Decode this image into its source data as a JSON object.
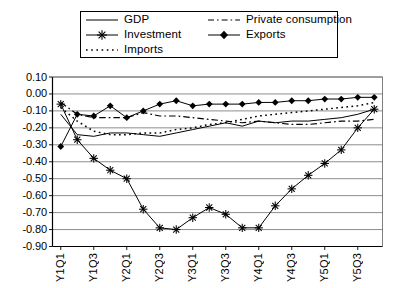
{
  "chart_data": {
    "type": "line",
    "title": "",
    "subtitle": "",
    "xlabel": "",
    "ylabel": "",
    "grid": "horizontal",
    "legend_position": "top",
    "ylim": [
      -0.9,
      0.1
    ],
    "ytick_step": 0.1,
    "ytick_labels": [
      "0.10",
      "0.00",
      "-0.10",
      "-0.20",
      "-0.30",
      "-0.40",
      "-0.50",
      "-0.60",
      "-0.70",
      "-0.80",
      "-0.90"
    ],
    "ytick_values": [
      0.1,
      0.0,
      -0.1,
      -0.2,
      -0.3,
      -0.4,
      -0.5,
      -0.6,
      -0.7,
      -0.8,
      -0.9
    ],
    "x": [
      "Y1Q1",
      "Y1Q2",
      "Y1Q3",
      "Y1Q4",
      "Y2Q1",
      "Y2Q2",
      "Y2Q3",
      "Y2Q4",
      "Y3Q1",
      "Y3Q2",
      "Y3Q3",
      "Y3Q4",
      "Y4Q1",
      "Y4Q2",
      "Y4Q3",
      "Y4Q4",
      "Y5Q1",
      "Y5Q2",
      "Y5Q3",
      "Y5Q4"
    ],
    "xtick_labels": [
      "Y1Q1",
      "Y1Q3",
      "Y2Q1",
      "Y2Q3",
      "Y3Q1",
      "Y3Q3",
      "Y4Q1",
      "Y4Q3",
      "Y5Q1",
      "Y5Q3"
    ],
    "xtick_every": 2,
    "series": [
      {
        "name": "GDP",
        "style": "solid",
        "marker": "none",
        "color": "#000000",
        "values": [
          -0.12,
          -0.24,
          -0.25,
          -0.23,
          -0.23,
          -0.24,
          -0.25,
          -0.23,
          -0.21,
          -0.19,
          -0.17,
          -0.19,
          -0.16,
          -0.17,
          -0.16,
          -0.16,
          -0.15,
          -0.14,
          -0.12,
          -0.09
        ]
      },
      {
        "name": "Investment",
        "style": "solid",
        "marker": "star",
        "color": "#000000",
        "values": [
          -0.06,
          -0.27,
          -0.38,
          -0.45,
          -0.5,
          -0.68,
          -0.79,
          -0.8,
          -0.73,
          -0.67,
          -0.71,
          -0.79,
          -0.79,
          -0.66,
          -0.56,
          -0.48,
          -0.41,
          -0.33,
          -0.2,
          -0.09
        ]
      },
      {
        "name": "Imports",
        "style": "dotted",
        "marker": "none",
        "color": "#000000",
        "values": [
          -0.08,
          -0.16,
          -0.22,
          -0.24,
          -0.24,
          -0.23,
          -0.23,
          -0.21,
          -0.2,
          -0.18,
          -0.17,
          -0.15,
          -0.13,
          -0.12,
          -0.11,
          -0.1,
          -0.09,
          -0.08,
          -0.07,
          -0.05
        ]
      },
      {
        "name": "Private consumption",
        "style": "dashdot",
        "marker": "none",
        "color": "#000000",
        "values": [
          -0.05,
          -0.12,
          -0.14,
          -0.14,
          -0.14,
          -0.11,
          -0.13,
          -0.13,
          -0.14,
          -0.15,
          -0.16,
          -0.17,
          -0.16,
          -0.17,
          -0.18,
          -0.18,
          -0.17,
          -0.16,
          -0.16,
          -0.15
        ]
      },
      {
        "name": "Exports",
        "style": "solid",
        "marker": "diamond",
        "color": "#000000",
        "values": [
          -0.31,
          -0.12,
          -0.13,
          -0.07,
          -0.14,
          -0.1,
          -0.06,
          -0.04,
          -0.07,
          -0.06,
          -0.06,
          -0.06,
          -0.05,
          -0.05,
          -0.04,
          -0.04,
          -0.03,
          -0.03,
          -0.02,
          -0.02
        ]
      }
    ]
  },
  "legend": {
    "items": [
      {
        "label": "GDP",
        "key": "solid-line-key"
      },
      {
        "label": "Investment",
        "key": "star-marker-line-key"
      },
      {
        "label": "Imports",
        "key": "dotted-line-key"
      },
      {
        "label": "Private consumption",
        "key": "dashdot-line-key"
      },
      {
        "label": "Exports",
        "key": "diamond-marker-line-key"
      }
    ]
  }
}
